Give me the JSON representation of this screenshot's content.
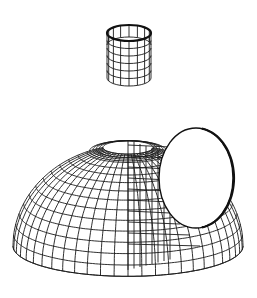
{
  "figure": {
    "caption": "",
    "colors": {
      "background": "#ffffff",
      "line": "#1a1a1a"
    },
    "parts": [
      {
        "name": "dome-shell"
      },
      {
        "name": "top-nozzle"
      },
      {
        "name": "side-opening"
      }
    ]
  }
}
